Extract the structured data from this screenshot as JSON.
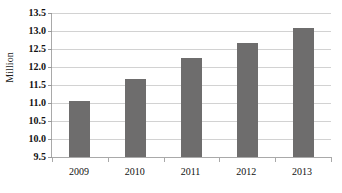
{
  "chart_data": {
    "type": "bar",
    "title": "",
    "subtitle": "",
    "xlabel": "",
    "ylabel": "Million",
    "categories": [
      "2009",
      "2010",
      "2011",
      "2012",
      "2013"
    ],
    "values": [
      11.05,
      11.68,
      12.25,
      12.67,
      13.07
    ],
    "series": [
      {
        "name": "Million",
        "values": [
          11.05,
          11.68,
          12.25,
          12.67,
          13.07
        ]
      }
    ],
    "ylim": [
      9.5,
      13.5
    ],
    "ytick_labels": [
      "13.5",
      "13.0",
      "12.5",
      "12.0",
      "11.5",
      "11.0",
      "10.5",
      "10.0",
      "9.5"
    ],
    "ytick_values": [
      13.5,
      13.0,
      12.5,
      12.0,
      11.5,
      11.0,
      10.5,
      10.0,
      9.5
    ],
    "ytick_step": 0.5,
    "grid": true,
    "grid_axis": "y",
    "legend": false,
    "legend_position": "none",
    "bar_color": "#6e6d6d",
    "gridline_color": "#d2d2d2",
    "axis_color": "#a9a9a9",
    "background_color": "#ffffff",
    "annotations": []
  }
}
